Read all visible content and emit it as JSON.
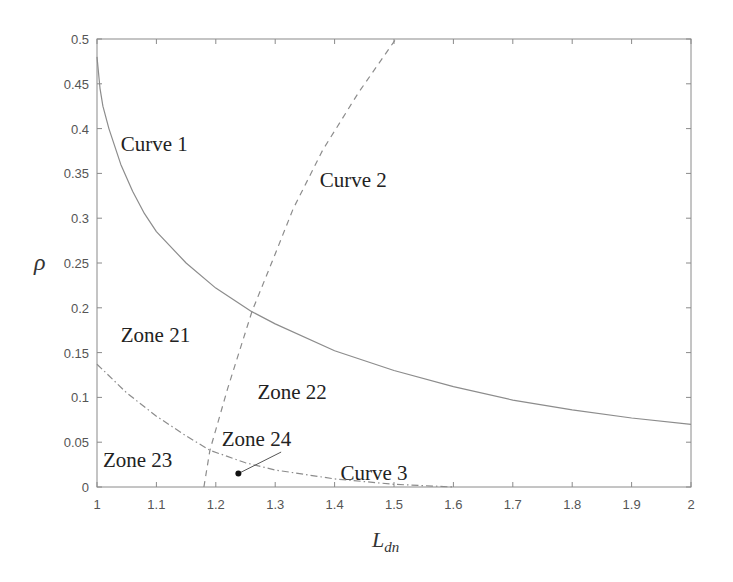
{
  "chart_data": {
    "type": "line",
    "title": "",
    "xlabel": "L",
    "xlabel_sub": "dn",
    "ylabel": "ρ",
    "xlim": [
      1,
      2
    ],
    "ylim": [
      0,
      0.5
    ],
    "grid": false,
    "legend": null,
    "x_ticks": [
      "1",
      "1.1",
      "1.2",
      "1.3",
      "1.4",
      "1.5",
      "1.6",
      "1.7",
      "1.8",
      "1.9",
      "2"
    ],
    "y_ticks": [
      "0",
      "0.05",
      "0.1",
      "0.15",
      "0.2",
      "0.25",
      "0.3",
      "0.35",
      "0.4",
      "0.45",
      "0.5"
    ],
    "series": [
      {
        "name": "Curve 1",
        "style": "solid",
        "x": [
          1.0,
          1.005,
          1.01,
          1.02,
          1.04,
          1.06,
          1.08,
          1.1,
          1.15,
          1.2,
          1.26,
          1.3,
          1.4,
          1.5,
          1.6,
          1.7,
          1.8,
          1.9,
          2.0
        ],
        "y": [
          0.48,
          0.445,
          0.425,
          0.4,
          0.36,
          0.33,
          0.305,
          0.285,
          0.25,
          0.222,
          0.196,
          0.182,
          0.152,
          0.13,
          0.112,
          0.097,
          0.086,
          0.077,
          0.07
        ]
      },
      {
        "name": "Curve 2",
        "style": "dashed",
        "x": [
          1.18,
          1.19,
          1.22,
          1.261,
          1.3,
          1.33,
          1.38,
          1.44,
          1.503
        ],
        "y": [
          0.0,
          0.041,
          0.11,
          0.196,
          0.26,
          0.31,
          0.376,
          0.44,
          0.5
        ]
      },
      {
        "name": "Curve 3",
        "style": "dashdot",
        "x": [
          1.0,
          1.05,
          1.1,
          1.15,
          1.19,
          1.25,
          1.3,
          1.4,
          1.5,
          1.6
        ],
        "y": [
          0.137,
          0.105,
          0.079,
          0.057,
          0.041,
          0.027,
          0.019,
          0.009,
          0.003,
          0.0
        ]
      }
    ],
    "annotations": [
      {
        "text": "Curve 1",
        "x": 1.04,
        "y": 0.375
      },
      {
        "text": "Curve 2",
        "x": 1.375,
        "y": 0.335
      },
      {
        "text": "Curve 3",
        "x": 1.41,
        "y": 0.008
      },
      {
        "text": "Zone 21",
        "x": 1.04,
        "y": 0.162
      },
      {
        "text": "Zone 22",
        "x": 1.27,
        "y": 0.098
      },
      {
        "text": "Zone 23",
        "x": 1.01,
        "y": 0.022
      },
      {
        "text": "Zone 24",
        "x": 1.21,
        "y": 0.046
      }
    ],
    "marker": {
      "label": "Zone 24",
      "x": 1.238,
      "y": 0.015,
      "leader_to": {
        "x": 1.31,
        "y": 0.039
      }
    }
  }
}
